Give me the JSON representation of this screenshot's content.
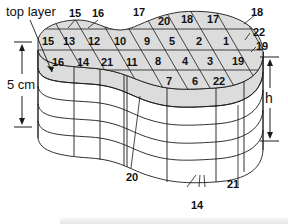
{
  "diagram": {
    "labels": {
      "top_layer": "top layer",
      "height_left": "5 cm",
      "height_right": "h"
    },
    "colors": {
      "top_fill": "#dcdcdc",
      "line": "#1a1a1a",
      "background": "#ffffff"
    },
    "top_cells": {
      "row1": [
        "15",
        "13",
        "12",
        "10",
        "9",
        "5",
        "2",
        "1"
      ],
      "row2": [
        "16",
        "14",
        "21",
        "11",
        "8",
        "4",
        "3",
        "19"
      ],
      "row3": [
        "7",
        "6",
        "22"
      ],
      "top_edge": [
        "20",
        "18",
        "17"
      ]
    },
    "callouts": {
      "c15": "15",
      "c16": "16",
      "c17": "17",
      "c18": "18",
      "c22": "22",
      "c19": "19",
      "c20": "20",
      "c14": "14",
      "c21": "21"
    }
  }
}
